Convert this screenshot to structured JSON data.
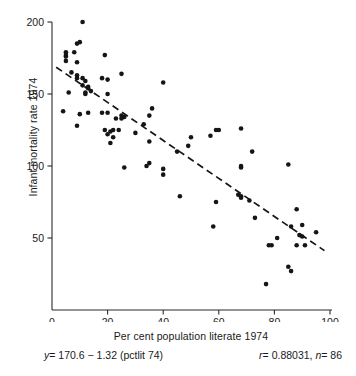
{
  "figure": {
    "title": "",
    "x_axis_title": "Per cent population literate 1974",
    "y_axis_title": "Infant mortality rate 1974",
    "equation": {
      "lhs": "y",
      "rest": "= 170.6 − 1.32 (pctlit 74)"
    },
    "stats": {
      "r_symbol": "r",
      "r_text": "= 0.88031,",
      "n_symbol": "n",
      "n_text": "= 86"
    },
    "ink_color": "#151515"
  },
  "chart_data": {
    "type": "scatter",
    "title": "",
    "xlabel": "Per cent population literate 1974",
    "ylabel": "Infant mortality rate 1974",
    "xlim": [
      0,
      100
    ],
    "ylim": [
      0,
      200
    ],
    "xticks": [
      0,
      20,
      40,
      60,
      80,
      100
    ],
    "yticks": [
      50,
      100,
      150,
      200
    ],
    "xticklabels": [
      "0",
      "20",
      "40",
      "60",
      "80",
      "100"
    ],
    "yticklabels": [
      "50",
      "100",
      "150",
      "200"
    ],
    "grid": false,
    "legend": null,
    "n": 86,
    "r": 0.88031,
    "fit": {
      "type": "dashed-line",
      "intercept": 170.6,
      "slope": -1.32,
      "equation": "y = 170.6 - 1.32 (pctlit 74)",
      "x_start": 1.5,
      "x_end": 98.0,
      "y_start": 168.6,
      "y_end": 41.2
    },
    "points": [
      [
        11,
        200
      ],
      [
        9,
        185
      ],
      [
        10,
        186
      ],
      [
        8,
        179
      ],
      [
        5,
        179
      ],
      [
        5,
        177
      ],
      [
        5,
        176
      ],
      [
        5,
        173
      ],
      [
        19,
        177
      ],
      [
        9,
        172
      ],
      [
        7,
        165
      ],
      [
        9,
        163
      ],
      [
        25,
        164
      ],
      [
        9,
        161
      ],
      [
        11,
        161
      ],
      [
        18,
        161
      ],
      [
        20,
        160
      ],
      [
        40,
        158
      ],
      [
        11,
        156
      ],
      [
        13,
        155
      ],
      [
        13,
        154
      ],
      [
        12,
        151
      ],
      [
        12,
        150
      ],
      [
        6,
        151
      ],
      [
        14,
        152
      ],
      [
        20,
        150
      ],
      [
        4,
        138
      ],
      [
        10,
        136
      ],
      [
        13,
        137
      ],
      [
        18,
        137
      ],
      [
        20,
        137
      ],
      [
        36,
        140
      ],
      [
        9,
        128
      ],
      [
        35,
        135
      ],
      [
        25,
        135
      ],
      [
        26,
        134
      ],
      [
        25,
        133
      ],
      [
        33,
        129
      ],
      [
        19,
        125
      ],
      [
        21,
        124
      ],
      [
        22,
        125
      ],
      [
        24,
        125
      ],
      [
        20,
        122
      ],
      [
        22,
        120
      ],
      [
        50,
        120
      ],
      [
        57,
        121
      ],
      [
        59,
        125
      ],
      [
        60,
        125
      ],
      [
        68,
        126
      ],
      [
        49,
        114
      ],
      [
        21,
        116
      ],
      [
        35,
        117
      ],
      [
        45,
        110
      ],
      [
        72,
        110
      ],
      [
        26,
        99
      ],
      [
        35,
        102
      ],
      [
        34,
        100
      ],
      [
        40,
        98
      ],
      [
        68,
        100
      ],
      [
        68,
        99
      ],
      [
        85,
        101
      ],
      [
        40,
        94
      ],
      [
        46,
        79
      ],
      [
        67,
        80
      ],
      [
        68,
        79
      ],
      [
        68,
        78
      ],
      [
        71,
        76
      ],
      [
        59,
        75
      ],
      [
        73,
        64
      ],
      [
        58,
        58
      ],
      [
        88,
        70
      ],
      [
        86,
        58
      ],
      [
        90,
        59
      ],
      [
        95,
        54
      ],
      [
        89,
        52
      ],
      [
        90,
        51
      ],
      [
        81,
        50
      ],
      [
        88,
        45
      ],
      [
        91,
        45
      ],
      [
        78,
        45
      ],
      [
        79,
        45
      ],
      [
        85,
        30
      ],
      [
        86,
        27
      ],
      [
        77,
        18
      ],
      [
        30,
        123
      ],
      [
        23,
        133
      ],
      [
        12,
        159
      ]
    ]
  }
}
